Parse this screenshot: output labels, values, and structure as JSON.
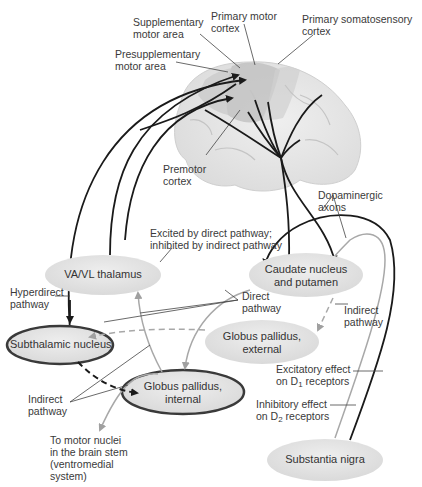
{
  "colors": {
    "cortex_highlight": "#b8b8b8",
    "brain": "#e6e6e6",
    "node_fill": "#e3e3e3",
    "node_outline_dark": "#3a3a3a",
    "excitatory_arrow": "#1a1a1a",
    "inhibitory_arrow": "#a8a8a8",
    "indirect_dashed": "#1a1a1a"
  },
  "cortex_labels": {
    "supplementary": "Supplementary\nmotor area",
    "presupplementary": "Presupplementary\nmotor area",
    "primary_motor": "Primary motor\ncortex",
    "primary_somatosensory": "Primary somatosensory\ncortex",
    "premotor": "Premotor\ncortex"
  },
  "nodes": {
    "thalamus": "VA/VL thalamus",
    "caudate": "Caudate nucleus\nand putamen",
    "subthalamic": "Subthalamic nucleus",
    "gp_external": "Globus pallidus,\nexternal",
    "gp_internal": "Globus pallidus,\ninternal",
    "substantia_nigra": "Substantia nigra"
  },
  "annotations": {
    "dopaminergic": "Dopaminergic\naxons",
    "thalamus_note": "Excited by direct pathway;\ninhibited by indirect pathway",
    "hyperdirect": "Hyperdirect\npathway",
    "direct": "Direct\npathway",
    "indirect_right": "Indirect\npathway",
    "indirect_left": "Indirect\npathway",
    "excitatory_d1_prefix": "Excitatory effect\non D",
    "excitatory_d1_sub": "1",
    "excitatory_d1_suffix": " receptors",
    "inhibitory_d2_prefix": "Inhibitory effect\non D",
    "inhibitory_d2_sub": "2",
    "inhibitory_d2_suffix": " receptors",
    "motor_nuclei": "To motor nuclei\nin the brain stem\n(ventromedial\nsystem)"
  }
}
